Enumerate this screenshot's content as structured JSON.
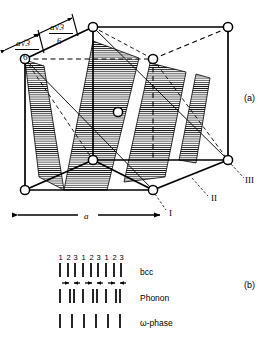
{
  "figure": {
    "panels": [
      {
        "tag": "(a)",
        "description": "bcc unit cell with shaded (111) planes"
      },
      {
        "tag": "(b)",
        "description": "plane stacking sequence diagram"
      }
    ]
  },
  "panel_a": {
    "tag": "(a)",
    "dimension_labels": [
      {
        "numerator": "a√3",
        "denominator": "6"
      },
      {
        "numerator": "a√3",
        "denominator": "6"
      }
    ],
    "edge_label": "a",
    "vertex_labels": [
      "I",
      "II",
      "III"
    ],
    "colors": {
      "line": "#000000",
      "hatch": "#000000",
      "atom_fill": "#ffffff"
    }
  },
  "panel_b": {
    "tag": "(b)",
    "plane_numbers": [
      "1",
      "2",
      "3",
      "1",
      "2",
      "3",
      "1",
      "2",
      "3"
    ],
    "rows": [
      {
        "label": "bcc",
        "tick_count": 9,
        "has_arrows": false
      },
      {
        "label": "Phonon",
        "tick_count": 9,
        "has_arrows": true
      },
      {
        "label": "ω-phase",
        "tick_count": 6,
        "has_arrows": false
      }
    ],
    "arrow_pairs": 3
  }
}
